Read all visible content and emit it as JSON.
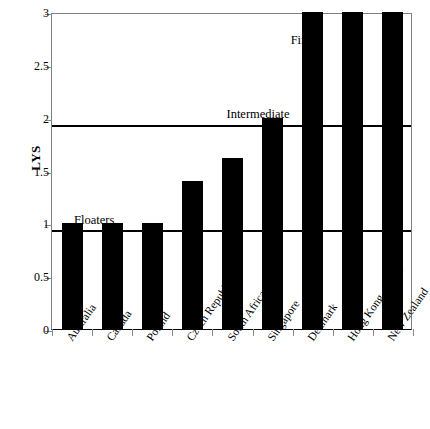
{
  "chart_data": {
    "type": "bar",
    "title": "",
    "xlabel": "",
    "ylabel": "LYS",
    "ylim": [
      0,
      3
    ],
    "ytick_values": [
      0,
      0.5,
      1,
      1.5,
      2,
      2.5,
      3
    ],
    "ytick_labels": [
      "0",
      "0.5",
      "1",
      "1.5",
      "2",
      "2.5",
      "3"
    ],
    "grid": false,
    "legend": "none",
    "bar_color": "#000000",
    "categories": [
      "Australia",
      "Canada",
      "Poland",
      "Czech Republic",
      "South Africa",
      "Singapore",
      "Denmark",
      "Hong Kong, China",
      "New Zealand"
    ],
    "values": [
      1.0,
      1.0,
      1.0,
      1.4,
      1.62,
      2.0,
      3.0,
      3.0,
      3.0
    ],
    "reference_lines": [
      {
        "label": "Floaters",
        "value": 0.96
      },
      {
        "label": "Intermediate",
        "value": 1.95
      }
    ],
    "annotations": [
      {
        "text": "Floaters",
        "x_value": 0.55,
        "y_value": 1.12
      },
      {
        "text": "Intermediate",
        "x_value": 4.35,
        "y_value": 2.12
      },
      {
        "text": "Fixers",
        "x_value": 5.95,
        "y_value": 2.82
      }
    ]
  }
}
